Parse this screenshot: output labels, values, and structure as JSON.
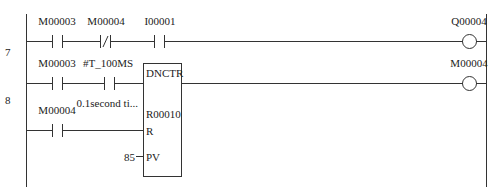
{
  "rungs": [
    {
      "number": "7",
      "elements": [
        {
          "type": "contact-no",
          "label": "M00003"
        },
        {
          "type": "contact-nc",
          "label": "M00004"
        },
        {
          "type": "contact-no",
          "label": "I00001"
        },
        {
          "type": "coil",
          "label": "Q00004"
        }
      ]
    },
    {
      "number": "8",
      "elements": [
        {
          "type": "contact-no",
          "label": "M00003"
        },
        {
          "type": "contact-no",
          "label": "#T_100MS",
          "comment": "0.1second ti..."
        },
        {
          "type": "contact-no",
          "label": "M00004"
        },
        {
          "type": "coil",
          "label": "M00004"
        }
      ],
      "function_block": {
        "name": "DNCTR",
        "operand": "R00010",
        "reset_pin": "R",
        "preset_pin": "PV",
        "preset_value": "85"
      }
    }
  ],
  "colors": {
    "line": "#333333",
    "background": "#ffffff"
  }
}
